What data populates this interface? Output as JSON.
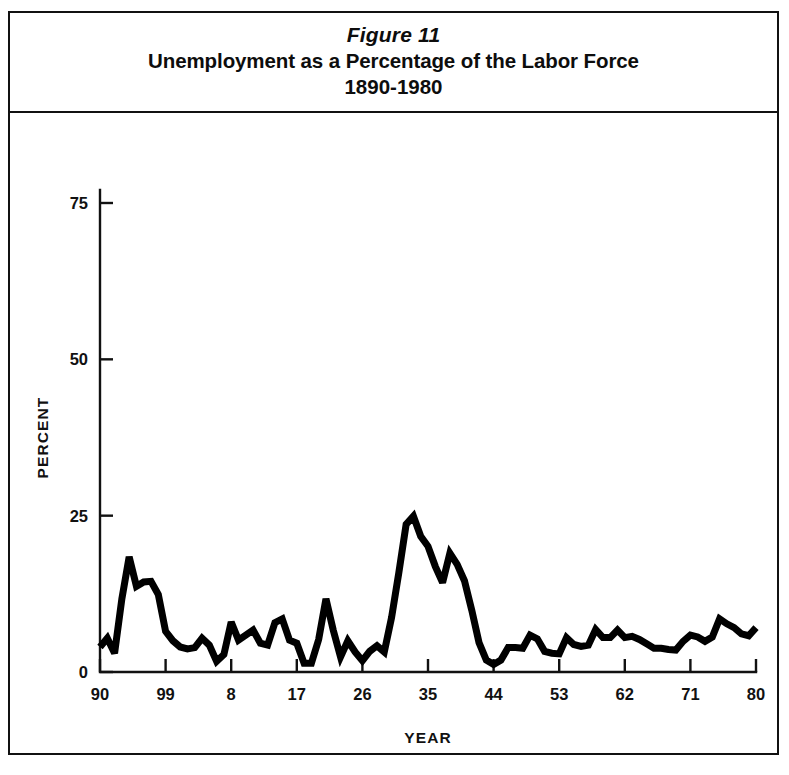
{
  "figure": {
    "number_label": "Figure 11",
    "title": "Unemployment as a Percentage of the Labor Force",
    "subtitle": "1890-1980"
  },
  "chart_data": {
    "type": "line",
    "title": "Unemployment as a Percentage of the Labor Force",
    "subtitle": "1890-1980",
    "figure_label": "Figure 11",
    "xlabel": "YEAR",
    "ylabel": "PERCENT",
    "xlim": [
      1890,
      1980
    ],
    "ylim": [
      0,
      75
    ],
    "yticks": [
      0,
      25,
      50,
      75
    ],
    "ytick_labels": [
      "0",
      "25",
      "50",
      "75"
    ],
    "xticks": [
      1890,
      1899,
      1908,
      1917,
      1926,
      1935,
      1944,
      1953,
      1962,
      1971,
      1980
    ],
    "xtick_labels": [
      "90",
      "99",
      "8",
      "17",
      "26",
      "35",
      "44",
      "53",
      "62",
      "71",
      "80"
    ],
    "grid": false,
    "legend": false,
    "line_color": "#000000",
    "line_width_px": 7,
    "series": [
      {
        "name": "Unemployment rate",
        "x": [
          1890,
          1891,
          1892,
          1893,
          1894,
          1895,
          1896,
          1897,
          1898,
          1899,
          1900,
          1901,
          1902,
          1903,
          1904,
          1905,
          1906,
          1907,
          1908,
          1909,
          1910,
          1911,
          1912,
          1913,
          1914,
          1915,
          1916,
          1917,
          1918,
          1919,
          1920,
          1921,
          1922,
          1923,
          1924,
          1925,
          1926,
          1927,
          1928,
          1929,
          1930,
          1931,
          1932,
          1933,
          1934,
          1935,
          1936,
          1937,
          1938,
          1939,
          1940,
          1941,
          1942,
          1943,
          1944,
          1945,
          1946,
          1947,
          1948,
          1949,
          1950,
          1951,
          1952,
          1953,
          1954,
          1955,
          1956,
          1957,
          1958,
          1959,
          1960,
          1961,
          1962,
          1963,
          1964,
          1965,
          1966,
          1967,
          1968,
          1969,
          1970,
          1971,
          1972,
          1973,
          1974,
          1975,
          1976,
          1977,
          1978,
          1979,
          1980
        ],
        "values": [
          4.0,
          5.4,
          3.0,
          11.7,
          18.4,
          13.7,
          14.4,
          14.5,
          12.4,
          6.5,
          5.0,
          4.0,
          3.7,
          3.9,
          5.4,
          4.3,
          1.7,
          2.8,
          8.0,
          5.1,
          5.9,
          6.7,
          4.6,
          4.3,
          7.9,
          8.5,
          5.1,
          4.6,
          1.4,
          1.4,
          5.2,
          11.7,
          6.7,
          2.4,
          5.0,
          3.2,
          1.8,
          3.3,
          4.2,
          3.2,
          8.7,
          15.9,
          23.6,
          24.9,
          21.7,
          20.1,
          16.9,
          14.3,
          19.0,
          17.2,
          14.6,
          9.9,
          4.7,
          1.9,
          1.2,
          1.9,
          3.9,
          3.9,
          3.8,
          5.9,
          5.3,
          3.3,
          3.0,
          2.9,
          5.5,
          4.4,
          4.1,
          4.3,
          6.8,
          5.5,
          5.5,
          6.7,
          5.5,
          5.7,
          5.2,
          4.5,
          3.8,
          3.8,
          3.6,
          3.5,
          4.9,
          5.9,
          5.6,
          4.9,
          5.6,
          8.5,
          7.7,
          7.1,
          6.1,
          5.8,
          7.1
        ]
      }
    ],
    "annotations": []
  }
}
